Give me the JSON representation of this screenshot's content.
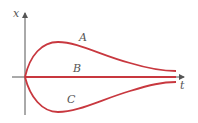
{
  "diagram": {
    "type": "solution-curves",
    "axes": {
      "vertical_label": "x",
      "horizontal_label": "t"
    },
    "curves": [
      {
        "label": "A",
        "description": "rises from origin to a maximum then decays toward the t-axis from above"
      },
      {
        "label": "B",
        "description": "coincides with the t-axis (x = 0)"
      },
      {
        "label": "C",
        "description": "falls from origin to a minimum then rises toward the t-axis from below"
      }
    ],
    "colors": {
      "curve": "#c8383f",
      "axis": "#555555"
    }
  }
}
